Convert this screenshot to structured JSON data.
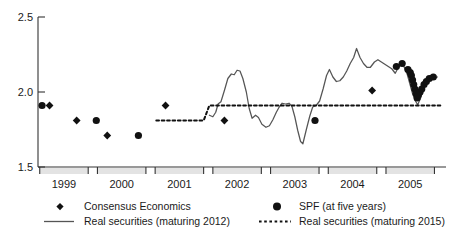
{
  "chart_data": {
    "type": "scatter",
    "title": "",
    "subtitle": "",
    "xlabel": "",
    "ylabel": "",
    "xlim": [
      1998.55,
      2005.62
    ],
    "ylim": [
      1.5,
      2.5
    ],
    "grid": false,
    "y_ticks": [
      "2.5",
      "2.0",
      "1.5"
    ],
    "y_tick_values": [
      2.5,
      2.0,
      1.5
    ],
    "x_ticks": [
      "1999",
      "2000",
      "2001",
      "2002",
      "2003",
      "2004",
      "2005"
    ],
    "x_tick_values": [
      1999,
      2000,
      2001,
      2002,
      2003,
      2004,
      2005
    ],
    "legend_position": "below-plot",
    "series": [
      {
        "name": "Consensus Economics",
        "marker": "diamond",
        "color": "#111111",
        "points": [
          {
            "x": 1998.75,
            "y": 1.91
          },
          {
            "x": 1999.22,
            "y": 1.81
          },
          {
            "x": 1999.75,
            "y": 1.71
          },
          {
            "x": 2000.76,
            "y": 1.91
          },
          {
            "x": 2001.78,
            "y": 1.81
          },
          {
            "x": 2004.34,
            "y": 2.01
          }
        ]
      },
      {
        "name": "SPF (at five years)",
        "marker": "circle",
        "color": "#111111",
        "points": [
          {
            "x": 1998.62,
            "y": 1.91
          },
          {
            "x": 1999.56,
            "y": 1.81
          },
          {
            "x": 2000.29,
            "y": 1.71
          },
          {
            "x": 2003.35,
            "y": 1.81
          },
          {
            "x": 2004.76,
            "y": 2.17
          },
          {
            "x": 2004.86,
            "y": 2.19
          },
          {
            "x": 2004.96,
            "y": 2.15
          },
          {
            "x": 2005.0,
            "y": 2.13
          },
          {
            "x": 2005.02,
            "y": 2.11
          },
          {
            "x": 2005.04,
            "y": 2.08
          },
          {
            "x": 2005.06,
            "y": 2.05
          },
          {
            "x": 2005.08,
            "y": 2.02
          },
          {
            "x": 2005.1,
            "y": 1.99
          },
          {
            "x": 2005.12,
            "y": 1.96
          },
          {
            "x": 2005.14,
            "y": 1.98
          },
          {
            "x": 2005.17,
            "y": 2.0
          },
          {
            "x": 2005.2,
            "y": 2.02
          },
          {
            "x": 2005.24,
            "y": 2.05
          },
          {
            "x": 2005.28,
            "y": 2.07
          },
          {
            "x": 2005.33,
            "y": 2.09
          },
          {
            "x": 2005.4,
            "y": 2.1
          }
        ]
      },
      {
        "name": "Real securities (maturing 2012)",
        "marker": "line",
        "style": "solid",
        "color": "#555555",
        "points": [
          {
            "x": 2001.52,
            "y": 1.845
          },
          {
            "x": 2001.58,
            "y": 1.835
          },
          {
            "x": 2001.63,
            "y": 1.865
          },
          {
            "x": 2001.67,
            "y": 1.92
          },
          {
            "x": 2001.72,
            "y": 1.935
          },
          {
            "x": 2001.78,
            "y": 2.01
          },
          {
            "x": 2001.84,
            "y": 2.09
          },
          {
            "x": 2001.9,
            "y": 2.12
          },
          {
            "x": 2001.95,
            "y": 2.115
          },
          {
            "x": 2002.0,
            "y": 2.145
          },
          {
            "x": 2002.05,
            "y": 2.14
          },
          {
            "x": 2002.1,
            "y": 2.09
          },
          {
            "x": 2002.16,
            "y": 2.0
          },
          {
            "x": 2002.21,
            "y": 1.89
          },
          {
            "x": 2002.26,
            "y": 1.825
          },
          {
            "x": 2002.32,
            "y": 1.845
          },
          {
            "x": 2002.37,
            "y": 1.83
          },
          {
            "x": 2002.43,
            "y": 1.785
          },
          {
            "x": 2002.5,
            "y": 1.765
          },
          {
            "x": 2002.56,
            "y": 1.775
          },
          {
            "x": 2002.62,
            "y": 1.815
          },
          {
            "x": 2002.68,
            "y": 1.865
          },
          {
            "x": 2002.73,
            "y": 1.9
          },
          {
            "x": 2002.78,
            "y": 1.925
          },
          {
            "x": 2002.84,
            "y": 1.92
          },
          {
            "x": 2002.9,
            "y": 1.925
          },
          {
            "x": 2002.95,
            "y": 1.905
          },
          {
            "x": 2003.0,
            "y": 1.835
          },
          {
            "x": 2003.05,
            "y": 1.745
          },
          {
            "x": 2003.1,
            "y": 1.67
          },
          {
            "x": 2003.14,
            "y": 1.655
          },
          {
            "x": 2003.2,
            "y": 1.75
          },
          {
            "x": 2003.26,
            "y": 1.84
          },
          {
            "x": 2003.31,
            "y": 1.9
          },
          {
            "x": 2003.37,
            "y": 1.91
          },
          {
            "x": 2003.43,
            "y": 1.94
          },
          {
            "x": 2003.49,
            "y": 2.02
          },
          {
            "x": 2003.55,
            "y": 2.11
          },
          {
            "x": 2003.6,
            "y": 2.15
          },
          {
            "x": 2003.66,
            "y": 2.1
          },
          {
            "x": 2003.72,
            "y": 2.07
          },
          {
            "x": 2003.78,
            "y": 2.075
          },
          {
            "x": 2003.84,
            "y": 2.1
          },
          {
            "x": 2003.9,
            "y": 2.14
          },
          {
            "x": 2003.96,
            "y": 2.19
          },
          {
            "x": 2004.02,
            "y": 2.23
          },
          {
            "x": 2004.07,
            "y": 2.29
          },
          {
            "x": 2004.13,
            "y": 2.23
          },
          {
            "x": 2004.19,
            "y": 2.19
          },
          {
            "x": 2004.25,
            "y": 2.165
          },
          {
            "x": 2004.31,
            "y": 2.165
          },
          {
            "x": 2004.38,
            "y": 2.2
          },
          {
            "x": 2004.44,
            "y": 2.215
          },
          {
            "x": 2004.5,
            "y": 2.2
          },
          {
            "x": 2004.56,
            "y": 2.185
          },
          {
            "x": 2004.62,
            "y": 2.17
          },
          {
            "x": 2004.68,
            "y": 2.155
          },
          {
            "x": 2004.74,
            "y": 2.125
          },
          {
            "x": 2004.79,
            "y": 2.16
          },
          {
            "x": 2004.84,
            "y": 2.19
          },
          {
            "x": 2004.89,
            "y": 2.17
          },
          {
            "x": 2004.94,
            "y": 2.13
          },
          {
            "x": 2004.99,
            "y": 2.06
          },
          {
            "x": 2005.04,
            "y": 1.99
          },
          {
            "x": 2005.09,
            "y": 1.94
          },
          {
            "x": 2005.13,
            "y": 1.915
          },
          {
            "x": 2005.18,
            "y": 1.96
          },
          {
            "x": 2005.23,
            "y": 2.02
          },
          {
            "x": 2005.29,
            "y": 2.07
          },
          {
            "x": 2005.35,
            "y": 2.1
          },
          {
            "x": 2005.41,
            "y": 2.09
          },
          {
            "x": 2005.47,
            "y": 2.1
          }
        ]
      },
      {
        "name": "Real securities (maturing 2015)",
        "marker": "line",
        "style": "dotted",
        "color": "#111111",
        "points": [
          {
            "x": 2000.6,
            "y": 1.81
          },
          {
            "x": 2001.42,
            "y": 1.81
          },
          {
            "x": 2001.52,
            "y": 1.91
          },
          {
            "x": 2005.55,
            "y": 1.91
          }
        ]
      }
    ]
  },
  "legend": {
    "items": [
      {
        "label": "Consensus Economics",
        "marker": "diamond"
      },
      {
        "label": "SPF (at five years)",
        "marker": "circle"
      },
      {
        "label": "Real securities (maturing 2012)",
        "marker": "solid-line"
      },
      {
        "label": "Real securities (maturing 2015)",
        "marker": "dotted-line"
      }
    ]
  },
  "colors": {
    "axis": "#333333",
    "marker": "#111111",
    "solid_line": "#555555",
    "dotted_line": "#111111",
    "band": "#e3e3e3"
  }
}
